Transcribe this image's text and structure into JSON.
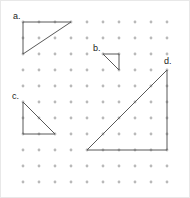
{
  "figure": {
    "width": 190,
    "height": 198,
    "background_color": "#ffffff",
    "border_color": "#e8e8e8"
  },
  "grid": {
    "name": "dot-grid",
    "dot_color": "#b9b9b9",
    "dot_radius": 1.4,
    "origin_x": 22,
    "origin_y": 21,
    "spacing": 16,
    "columns": 10,
    "rows": 11
  },
  "style": {
    "line_color": "#595959",
    "line_width": 1,
    "label_color": "#1a1a1a",
    "label_font_size": 9
  },
  "shapes": [
    {
      "id": "a",
      "label": "a.",
      "type": "right-triangle",
      "label_x": 12,
      "label_y": 11,
      "points": "22,21 70,21 22,53",
      "grid_points": [
        [
          0,
          0
        ],
        [
          3,
          0
        ],
        [
          0,
          2
        ]
      ],
      "legs": {
        "horizontal": 3,
        "vertical": 2
      },
      "right_angle_at": "top-left"
    },
    {
      "id": "b",
      "label": "b.",
      "type": "right-triangle",
      "label_x": 92,
      "label_y": 43,
      "points": "102,53 118,53 118,69",
      "grid_points": [
        [
          5,
          2
        ],
        [
          6,
          2
        ],
        [
          6,
          3
        ]
      ],
      "legs": {
        "horizontal": 1,
        "vertical": 1
      },
      "right_angle_at": "top-right"
    },
    {
      "id": "c",
      "label": "c.",
      "type": "right-triangle",
      "label_x": 11,
      "label_y": 91,
      "points": "22,101 22,133 54,133",
      "grid_points": [
        [
          0,
          5
        ],
        [
          0,
          7
        ],
        [
          2,
          7
        ]
      ],
      "legs": {
        "horizontal": 2,
        "vertical": 2
      },
      "right_angle_at": "bottom-left"
    },
    {
      "id": "d",
      "label": "d.",
      "type": "right-triangle",
      "label_x": 163,
      "label_y": 56,
      "points": "166,69 166,149 86,149",
      "grid_points": [
        [
          9,
          3
        ],
        [
          9,
          8
        ],
        [
          4,
          8
        ]
      ],
      "legs": {
        "horizontal": 5,
        "vertical": 5
      },
      "right_angle_at": "bottom-right"
    }
  ]
}
